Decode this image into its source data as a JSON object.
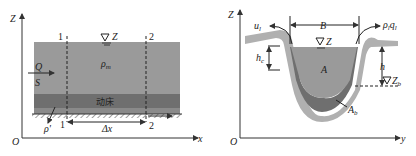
{
  "left_diagram": {
    "axis_y_label": "Z",
    "axis_x_label": "x",
    "origin_label": "O",
    "section_1_top": "1",
    "section_2_top": "2",
    "section_1_bottom": "1",
    "section_2_bottom": "2",
    "water_level_label": "Z",
    "flow_label": "Q",
    "sediment_label": "S",
    "density_label": "ρ",
    "density_sub": "m",
    "bed_label": "动床",
    "bed_density_label": "ρ'",
    "dx_label": "Δx"
  },
  "right_diagram": {
    "axis_y_label": "Z",
    "axis_x_label": "y",
    "origin_label": "O",
    "lateral_inflow_left": "u",
    "lateral_inflow_left_sub": "l",
    "lateral_inflow_right": "ρ",
    "lateral_inflow_right_sub": "l",
    "lateral_inflow_right_q": "q",
    "lateral_inflow_right_q_sub": "l",
    "width_label": "B",
    "water_level_label": "Z",
    "area_label": "A",
    "hc_label": "h",
    "hc_sub": "c",
    "h_label": "h",
    "zb_label": "Z",
    "zb_sub": "b",
    "ab_label": "A",
    "ab_sub": "b"
  },
  "colors": {
    "water": "#9a9a9a",
    "bed_layer": "#6f6f6f",
    "lower_layer": "#8a8a8a",
    "bank": "#b0b0b0",
    "axis": "#333333"
  }
}
